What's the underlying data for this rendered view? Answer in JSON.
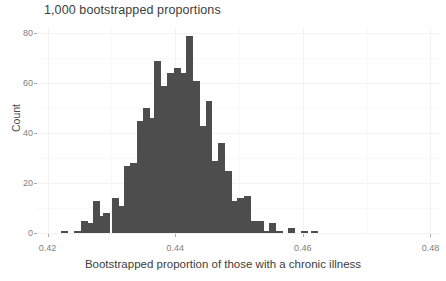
{
  "chart_data": {
    "type": "bar",
    "title": "1,000 bootstrapped proportions",
    "xlabel": "Bootstrapped proportion of those with a chronic illness",
    "ylabel": "Count",
    "xlim": [
      0.4185,
      0.4815
    ],
    "ylim": [
      0,
      82
    ],
    "grid": true,
    "legend": false,
    "bar_color": "#4d4d4d",
    "bin_width": 0.00127,
    "xticks": [
      0.42,
      0.44,
      0.46,
      0.48
    ],
    "xtick_labels": [
      "0.42",
      "0.44",
      "0.46",
      "0.48"
    ],
    "yticks": [
      0,
      20,
      40,
      60,
      80
    ],
    "ytick_labels": [
      "0",
      "20",
      "40",
      "60",
      "80"
    ],
    "x": [
      0.4227,
      0.4247,
      0.4258,
      0.4266,
      0.4276,
      0.4284,
      0.4292,
      0.4307,
      0.4315,
      0.4325,
      0.4335,
      0.4345,
      0.4355,
      0.4365,
      0.4373,
      0.4383,
      0.4393,
      0.4403,
      0.4413,
      0.4423,
      0.4433,
      0.4443,
      0.4453,
      0.4463,
      0.4473,
      0.4483,
      0.4493,
      0.4503,
      0.4513,
      0.4523,
      0.4533,
      0.4543,
      0.4553,
      0.4563,
      0.4583,
      0.4602,
      0.4619
    ],
    "values": [
      1,
      1,
      5,
      4,
      13,
      7,
      8,
      14,
      11,
      27,
      28,
      45,
      50,
      46,
      69,
      59,
      64,
      66,
      64,
      79,
      61,
      43,
      53,
      29,
      36,
      25,
      13,
      14,
      15,
      5,
      5,
      1,
      4,
      1,
      2,
      1,
      1
    ]
  },
  "chart": {
    "title": "1,000 bootstrapped proportions",
    "x_axis_title": "Bootstrapped proportion of those with a chronic illness",
    "y_axis_title": "Count"
  }
}
